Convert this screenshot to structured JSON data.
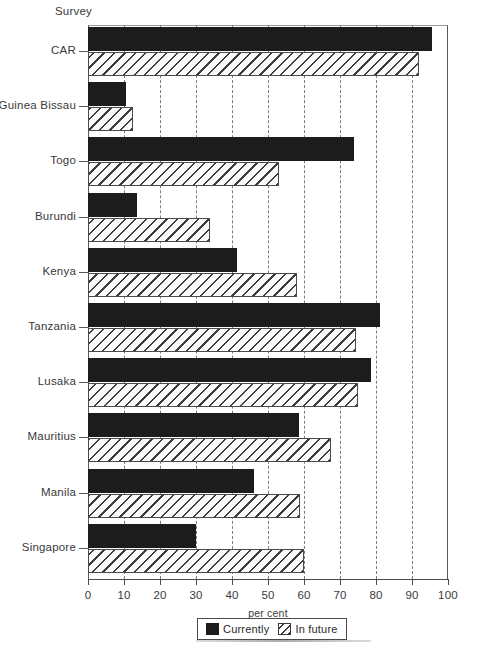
{
  "axis_header": "Survey",
  "chart_data": {
    "type": "bar",
    "orientation": "horizontal",
    "title": "",
    "xlabel": "per cent",
    "ylabel": "Survey",
    "xlim": [
      0,
      100
    ],
    "xticks": [
      0,
      10,
      20,
      30,
      40,
      50,
      60,
      70,
      80,
      90,
      100
    ],
    "grid": "vertical dashed gridlines every 10 per cent",
    "legend_position": "bottom-center",
    "categories": [
      "CAR",
      "Guinea Bissau",
      "Togo",
      "Burundi",
      "Kenya",
      "Tanzania",
      "Lusaka",
      "Mauritius",
      "Manila",
      "Singapore"
    ],
    "series": [
      {
        "name": "Currently",
        "style": "solid-black",
        "values": [
          95.5,
          10.5,
          74,
          13.5,
          41.5,
          81,
          78.5,
          58.5,
          46,
          30
        ]
      },
      {
        "name": "In future",
        "style": "diagonal-hatch",
        "values": [
          92,
          12.5,
          53,
          34,
          58,
          74.5,
          75,
          67.5,
          59,
          60
        ]
      }
    ]
  },
  "legend": {
    "entries": [
      {
        "label": "Currently",
        "swatch": "solid-black-swatch"
      },
      {
        "label": "In future",
        "swatch": "hatched-swatch"
      }
    ]
  }
}
